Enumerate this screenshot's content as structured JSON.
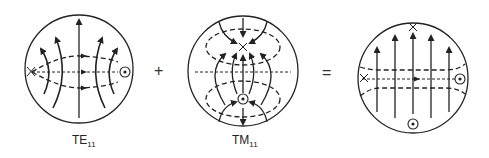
{
  "diagram": {
    "colors": {
      "line": "#222222",
      "background": "#ffffff"
    },
    "panels": [
      {
        "id": "te11",
        "label_main": "TE",
        "label_sub": "11"
      },
      {
        "id": "tm11",
        "label_main": "TM",
        "label_sub": "11"
      },
      {
        "id": "sum",
        "label_main": "",
        "label_sub": ""
      }
    ],
    "operators": {
      "plus": "+",
      "equals": "="
    },
    "legend_symbols": {
      "x-mark": "field into page",
      "dot-circle": "field out of page",
      "solid-arrow": "electric field line",
      "dashed-line": "magnetic field line"
    }
  }
}
